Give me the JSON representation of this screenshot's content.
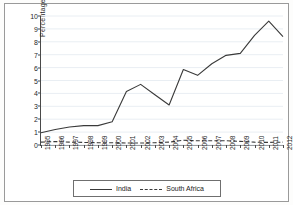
{
  "chart_data": {
    "type": "line",
    "title": "",
    "xlabel": "",
    "ylabel": "Percentage",
    "x": [
      "1995",
      "1996",
      "1997",
      "1998",
      "1999",
      "2000",
      "2001",
      "2002",
      "2003",
      "2004",
      "2005",
      "2006",
      "2007",
      "2008",
      "2009",
      "2010",
      "2011",
      "2012"
    ],
    "ylim": [
      0,
      10
    ],
    "yticks": [
      "0",
      "1",
      "2",
      "3",
      "4",
      "5",
      "6",
      "7",
      "8",
      "9",
      "10"
    ],
    "grid": "horizontal",
    "legend_position": "bottom",
    "series": [
      {
        "name": "India",
        "style": "solid",
        "color": "#3a3a3a",
        "values": [
          0.95,
          1.2,
          1.4,
          1.5,
          1.5,
          1.8,
          4.15,
          4.7,
          3.9,
          3.1,
          5.85,
          5.4,
          6.3,
          6.95,
          7.1,
          8.5,
          9.6,
          8.4
        ]
      },
      {
        "name": "South Africa",
        "style": "dashed",
        "color": "#3a3a3a",
        "values": [
          0.22,
          0.27,
          0.22,
          0.2,
          0.18,
          0.17,
          0.16,
          0.15,
          0.18,
          0.22,
          0.37,
          0.33,
          0.33,
          0.33,
          0.28,
          0.22,
          0.2,
          0.22
        ]
      }
    ]
  },
  "legend": {
    "items": [
      {
        "label": "India",
        "style": "solid"
      },
      {
        "label": "South Africa",
        "style": "dashed"
      }
    ]
  }
}
